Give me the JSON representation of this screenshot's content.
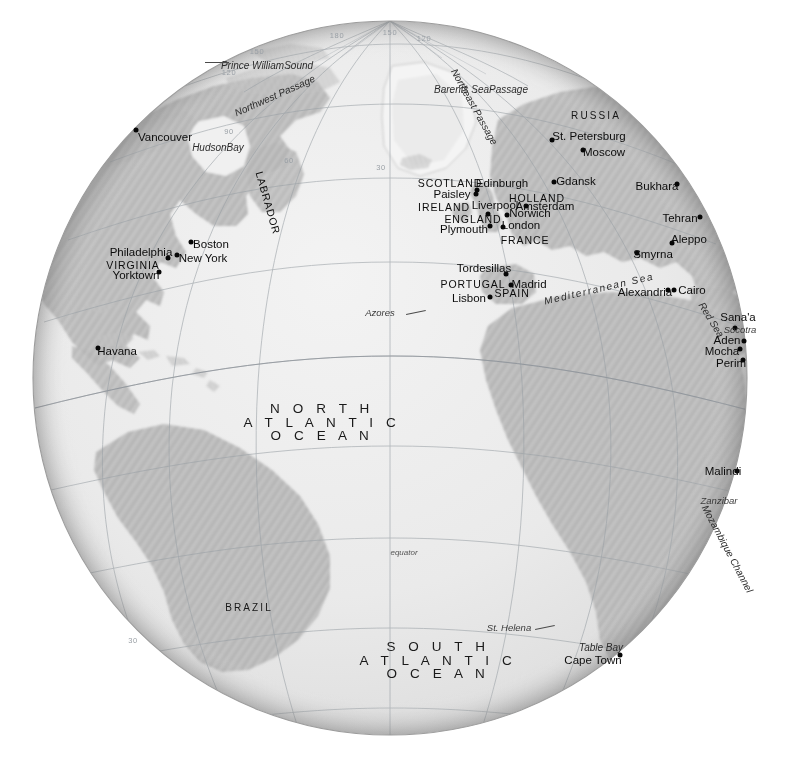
{
  "meta": {
    "projection": "orthographic",
    "background_color": "#ffffff",
    "ocean_color": "#ebebeb",
    "land_color": "#b8b8b8",
    "graticule_color": "#9aa0a6",
    "label_color": "#0c0c0c"
  },
  "oceans": [
    {
      "id": "north-atlantic",
      "lines": [
        "N O R T H",
        "A T L A N T I C",
        "O C E A N"
      ],
      "x": 322,
      "y": 422
    },
    {
      "id": "south-atlantic",
      "lines": [
        "S O U T H",
        "A T L A N T I C",
        "O C E A N"
      ],
      "x": 438,
      "y": 660
    }
  ],
  "regions": [
    {
      "name": "RUSSIA",
      "x": 596,
      "y": 116
    },
    {
      "name": "BRAZIL",
      "x": 249,
      "y": 608
    }
  ],
  "countries": [
    {
      "name": "SCOTLAND",
      "x": 450,
      "y": 183
    },
    {
      "name": "IRELAND",
      "x": 444,
      "y": 207
    },
    {
      "name": "ENGLAND",
      "x": 473,
      "y": 219
    },
    {
      "name": "HOLLAND",
      "x": 537,
      "y": 198
    },
    {
      "name": "FRANCE",
      "x": 525,
      "y": 240
    },
    {
      "name": "PORTUGAL",
      "x": 473,
      "y": 284
    },
    {
      "name": "SPAIN",
      "x": 512,
      "y": 293
    },
    {
      "name": "VIRGINIA",
      "x": 133,
      "y": 265
    },
    {
      "name": "LABRADOR",
      "x": 268,
      "y": 203,
      "rotated": "labrador"
    }
  ],
  "cities": [
    {
      "name": "Vancouver",
      "lx": 165,
      "ly": 138,
      "dx": 136,
      "dy": 130
    },
    {
      "name": "Boston",
      "lx": 211,
      "ly": 245,
      "dx": 191,
      "dy": 242
    },
    {
      "name": "New York",
      "lx": 203,
      "ly": 259,
      "dx": 177,
      "dy": 255
    },
    {
      "name": "Philadelphia",
      "lx": 141,
      "ly": 253,
      "dx": 168,
      "dy": 258
    },
    {
      "name": "Yorktown",
      "lx": 136,
      "ly": 276,
      "dx": 159,
      "dy": 272
    },
    {
      "name": "Havana",
      "lx": 117,
      "ly": 352,
      "dx": 98,
      "dy": 348
    },
    {
      "name": "St. Petersburg",
      "lx": 589,
      "ly": 137,
      "dx": 552,
      "dy": 140
    },
    {
      "name": "Moscow",
      "lx": 604,
      "ly": 153,
      "dx": 583,
      "dy": 150
    },
    {
      "name": "Gdansk",
      "lx": 576,
      "ly": 182,
      "dx": 554,
      "dy": 182
    },
    {
      "name": "Bukhara",
      "lx": 657,
      "ly": 187,
      "dx": 677,
      "dy": 184
    },
    {
      "name": "Tehran",
      "lx": 680,
      "ly": 219,
      "dx": 700,
      "dy": 217
    },
    {
      "name": "Aleppo",
      "lx": 689,
      "ly": 240,
      "dx": 672,
      "dy": 243
    },
    {
      "name": "Smyrna",
      "lx": 653,
      "ly": 255,
      "dx": 637,
      "dy": 253
    },
    {
      "name": "Edinburgh",
      "lx": 502,
      "ly": 184,
      "dx": 477,
      "dy": 190
    },
    {
      "name": "Paisley",
      "lx": 452,
      "ly": 195,
      "dx": 476,
      "dy": 194
    },
    {
      "name": "Liverpool",
      "lx": 495,
      "ly": 206,
      "dx": 488,
      "dy": 214
    },
    {
      "name": "Amsterdam",
      "lx": 545,
      "ly": 207,
      "dx": 526,
      "dy": 206
    },
    {
      "name": "Norwich",
      "lx": 530,
      "ly": 214,
      "dx": 507,
      "dy": 215
    },
    {
      "name": "London",
      "lx": 521,
      "ly": 226,
      "dx": 503,
      "dy": 227
    },
    {
      "name": "Plymouth",
      "lx": 464,
      "ly": 230,
      "dx": 490,
      "dy": 226
    },
    {
      "name": "Tordesillas",
      "lx": 484,
      "ly": 269,
      "dx": 506,
      "dy": 274
    },
    {
      "name": "Madrid",
      "lx": 529,
      "ly": 285,
      "dx": 511,
      "dy": 285
    },
    {
      "name": "Lisbon",
      "lx": 469,
      "ly": 299,
      "dx": 490,
      "dy": 297
    },
    {
      "name": "Alexandria",
      "lx": 645,
      "ly": 293,
      "dx": 668,
      "dy": 290
    },
    {
      "name": "Cairo",
      "lx": 692,
      "ly": 291,
      "dx": 674,
      "dy": 290
    },
    {
      "name": "Sana'a",
      "lx": 738,
      "ly": 318,
      "dx": 735,
      "dy": 328
    },
    {
      "name": "Aden",
      "lx": 727,
      "ly": 341,
      "dx": 744,
      "dy": 341
    },
    {
      "name": "Mocha",
      "lx": 722,
      "ly": 352,
      "dx": 740,
      "dy": 349
    },
    {
      "name": "Perim",
      "lx": 731,
      "ly": 364,
      "dx": 743,
      "dy": 360
    },
    {
      "name": "Malindi",
      "lx": 723,
      "ly": 472,
      "dx": 737,
      "dy": 471
    },
    {
      "name": "Cape Town",
      "lx": 593,
      "ly": 661,
      "dx": 620,
      "dy": 655
    }
  ],
  "water_features": [
    {
      "name": "Prince William Sound",
      "lines": [
        "Prince William",
        "Sound"
      ],
      "x": 267,
      "y": 66,
      "leader": true
    },
    {
      "name": "Northwest Passage",
      "x": 275,
      "y": 96,
      "rotated": "nwp"
    },
    {
      "name": "Barents Sea",
      "lines": [
        "Barents Sea",
        "Passage"
      ],
      "x": 481,
      "y": 90
    },
    {
      "name": "Northeast Passage",
      "x": 474,
      "y": 107,
      "rotated": "nep"
    },
    {
      "name": "Hudson Bay",
      "lines": [
        "Hudson",
        "Bay"
      ],
      "x": 218,
      "y": 148
    },
    {
      "name": "Mediterranean Sea",
      "x": 599,
      "y": 289,
      "rotated": "med"
    },
    {
      "name": "Red Sea",
      "x": 711,
      "y": 320,
      "rotated": "redsea"
    },
    {
      "name": "Mozambique Channel",
      "x": 727,
      "y": 549,
      "rotated": "mozam"
    },
    {
      "name": "Table Bay",
      "x": 601,
      "y": 648
    }
  ],
  "islands": [
    {
      "name": "Azores",
      "x": 380,
      "y": 313,
      "leader": true
    },
    {
      "name": "Socotra",
      "x": 740,
      "y": 330
    },
    {
      "name": "Zanzibar",
      "x": 719,
      "y": 501
    },
    {
      "name": "St. Helena",
      "x": 509,
      "y": 628,
      "leader": true
    }
  ],
  "lines": [
    {
      "name": "equator",
      "x": 404,
      "y": 553
    }
  ],
  "graticule_labels": [
    {
      "value": "180",
      "x": 337,
      "y": 36
    },
    {
      "value": "150",
      "x": 390,
      "y": 33
    },
    {
      "value": "120",
      "x": 424,
      "y": 39
    },
    {
      "value": "150",
      "x": 257,
      "y": 52
    },
    {
      "value": "120",
      "x": 229,
      "y": 73
    },
    {
      "value": "90",
      "x": 229,
      "y": 132
    },
    {
      "value": "60",
      "x": 289,
      "y": 161
    },
    {
      "value": "30",
      "x": 381,
      "y": 168
    },
    {
      "value": "30",
      "x": 133,
      "y": 641
    }
  ]
}
